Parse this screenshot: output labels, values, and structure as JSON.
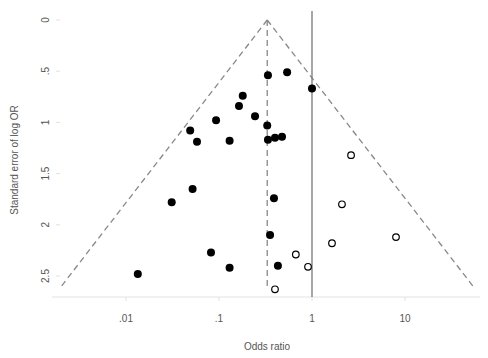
{
  "chart_data": {
    "type": "scatter",
    "subtype": "funnel-plot",
    "title": "",
    "xlabel": "Odds ratio",
    "ylabel": "Standard error of log OR",
    "x_scale": "log10",
    "y_reversed": true,
    "xlim": [
      0.0018,
      60
    ],
    "ylim": [
      0,
      2.7
    ],
    "x_ticks": [
      0.01,
      0.1,
      1,
      10
    ],
    "x_tick_labels": [
      ".01",
      ".1",
      "1",
      "10"
    ],
    "y_ticks": [
      0,
      0.5,
      1,
      1.5,
      2,
      2.5
    ],
    "y_tick_labels": [
      "0",
      ".5",
      "1",
      "1.5",
      "2",
      "2.5"
    ],
    "grid": false,
    "legend": null,
    "pooled_or": 0.33,
    "null_line_or": 1,
    "funnel_max_se": 2.62,
    "series": [
      {
        "name": "Observed studies",
        "marker": "filled-circle",
        "color": "#000000",
        "points": [
          {
            "or": 0.336,
            "se": 0.54
          },
          {
            "or": 0.54,
            "se": 0.51
          },
          {
            "or": 1.0,
            "se": 0.67
          },
          {
            "or": 0.18,
            "se": 0.74
          },
          {
            "or": 0.164,
            "se": 0.84
          },
          {
            "or": 0.244,
            "se": 0.94
          },
          {
            "or": 0.093,
            "se": 0.98
          },
          {
            "or": 0.33,
            "se": 1.03
          },
          {
            "or": 0.049,
            "se": 1.08
          },
          {
            "or": 0.058,
            "se": 1.19
          },
          {
            "or": 0.13,
            "se": 1.18
          },
          {
            "or": 0.336,
            "se": 1.17
          },
          {
            "or": 0.4,
            "se": 1.15
          },
          {
            "or": 0.476,
            "se": 1.14
          },
          {
            "or": 0.052,
            "se": 1.65
          },
          {
            "or": 0.031,
            "se": 1.78
          },
          {
            "or": 0.39,
            "se": 1.74
          },
          {
            "or": 0.354,
            "se": 2.1
          },
          {
            "or": 0.082,
            "se": 2.27
          },
          {
            "or": 0.13,
            "se": 2.42
          },
          {
            "or": 0.43,
            "se": 2.4
          },
          {
            "or": 0.0134,
            "se": 2.48
          }
        ]
      },
      {
        "name": "Imputed studies",
        "marker": "open-circle",
        "color": "#000000",
        "points": [
          {
            "or": 2.63,
            "se": 1.32
          },
          {
            "or": 2.1,
            "se": 1.8
          },
          {
            "or": 1.64,
            "se": 2.18
          },
          {
            "or": 8.0,
            "se": 2.12
          },
          {
            "or": 0.67,
            "se": 2.29
          },
          {
            "or": 0.906,
            "se": 2.41
          },
          {
            "or": 0.4,
            "se": 2.63
          }
        ]
      }
    ]
  },
  "layout": {
    "x_origin_px": 312,
    "px_per_decade": 93,
    "y_origin_px": 20,
    "px_per_se": 102.4,
    "axis_line_y": 297,
    "axis_line_x0": 52,
    "axis_line_x1": 480,
    "colors": {
      "dashed": "#888888",
      "solid": "#777777",
      "axis": "#e2e2e2",
      "text": "#555555",
      "marker": "#000000"
    }
  }
}
